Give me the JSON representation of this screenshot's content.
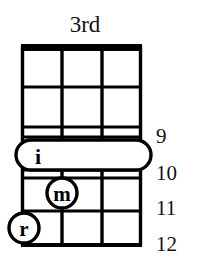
{
  "diagram": {
    "type": "chord-diagram",
    "instrument": "fretted-string-instrument",
    "title": "3rd",
    "ink_color": "#000000",
    "background_color": "#ffffff",
    "strings_count": 4,
    "fret_numbers": [
      "9",
      "10",
      "11",
      "12"
    ],
    "fret_number_side": "right",
    "nut_style": "thick-bar",
    "markers": [
      {
        "id": "barre-i",
        "label": "i",
        "shape": "stadium",
        "finger": "index",
        "fret": "9",
        "strings": "1-4",
        "is_barre": true
      },
      {
        "id": "dot-m",
        "label": "m",
        "shape": "circle",
        "finger": "middle",
        "fret": "10",
        "strings": "2",
        "is_barre": false
      },
      {
        "id": "dot-r",
        "label": "r",
        "shape": "circle",
        "finger": "ring",
        "fret": "11",
        "strings": "1",
        "is_barre": false
      }
    ]
  },
  "fret_labels": {
    "n9": "9",
    "n10": "10",
    "n11": "11",
    "n12": "12"
  },
  "marker_labels": {
    "index": "i",
    "middle": "m",
    "ring": "r"
  }
}
